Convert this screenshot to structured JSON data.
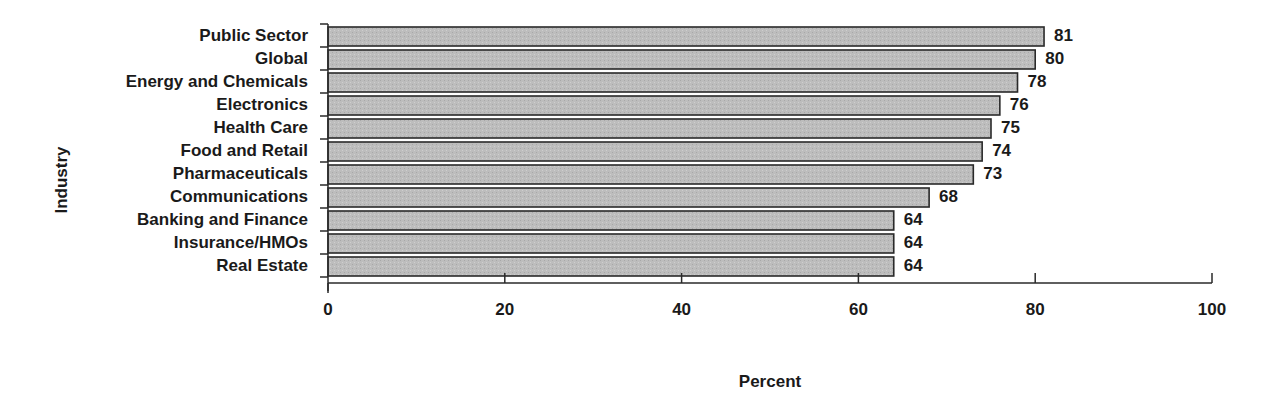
{
  "chart_data": {
    "type": "bar",
    "orientation": "horizontal",
    "title": "",
    "xlabel": "Percent",
    "ylabel": "Industry",
    "xlim": [
      0,
      100
    ],
    "xticks": [
      0,
      20,
      40,
      60,
      80,
      100
    ],
    "grid": false,
    "legend": null,
    "data_labels": true,
    "categories": [
      "Public Sector",
      "Global",
      "Energy and Chemicals",
      "Electronics",
      "Health Care",
      "Food and Retail",
      "Pharmaceuticals",
      "Communications",
      "Banking and Finance",
      "Insurance/HMOs",
      "Real Estate"
    ],
    "values": [
      81,
      80,
      78,
      76,
      75,
      74,
      73,
      68,
      64,
      64,
      64
    ],
    "colors": {
      "bar_fill": "#bdbdbd",
      "bar_stroke": "#2a2a2a",
      "text": "#1a1a1a"
    }
  }
}
